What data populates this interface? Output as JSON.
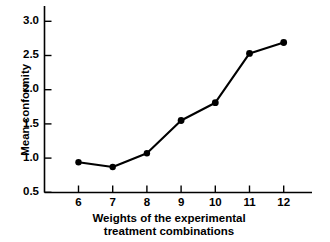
{
  "chart_data": {
    "type": "line",
    "title": "",
    "subtitle": "",
    "xlabel": "Weights of the experimental treatment combinations",
    "xlabel_lines": [
      "Weights of the experimental",
      "treatment combinations"
    ],
    "ylabel": "Mean conformity",
    "x": [
      6,
      7,
      8,
      9,
      10,
      11,
      12
    ],
    "values": [
      0.94,
      0.87,
      1.07,
      1.55,
      1.81,
      2.53,
      2.69
    ],
    "series": [
      {
        "name": "Mean conformity",
        "values": [
          0.94,
          0.87,
          1.07,
          1.55,
          1.81,
          2.53,
          2.69
        ]
      }
    ],
    "xtick_labels": [
      "6",
      "7",
      "8",
      "9",
      "10",
      "11",
      "12"
    ],
    "ytick_labels": [
      "0.5",
      "1.0",
      "1.5",
      "2.0",
      "2.5",
      "3.0"
    ],
    "ytick_values": [
      0.5,
      1.0,
      1.5,
      2.0,
      2.5,
      3.0
    ],
    "xlim": [
      5.5,
      12.8
    ],
    "ylim": [
      0.5,
      3.1
    ],
    "grid": false,
    "legend": false,
    "legend_position": "none",
    "marker": "filled-circle",
    "line_color": "#000000",
    "marker_color": "#000000",
    "background_color": "#ffffff"
  }
}
